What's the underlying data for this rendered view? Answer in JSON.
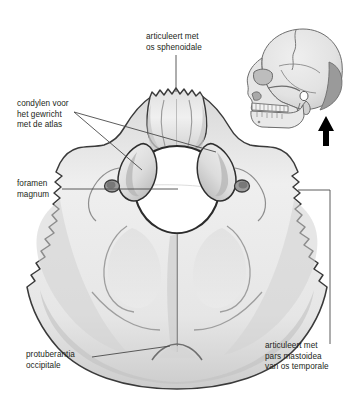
{
  "figure": {
    "background_color": "#ffffff",
    "bone_fill": "#ededed",
    "bone_shade_mid": "#c9c9c9",
    "bone_shade_dark": "#a8a8a8",
    "outline_color": "#3a3a3a",
    "foramen_fill": "#ffffff",
    "text_color": "#231f20",
    "leader_color": "#4a4a4a"
  },
  "labels": {
    "sphenoidale": "articuleert met\nos sphenoidale",
    "condylen": "condylen voor\nhet gewricht\nmet de atlas",
    "foramen": "foramen\nmagnum",
    "protuberantia": "protuberantia\noccipitale",
    "mastoidea": "articuleert met\npars mastoidea\nvan os temporale"
  },
  "inset": {
    "name": "lateral-skull-view",
    "highlight_color": "#9a9a9a",
    "skull_fill": "#e4e4e4",
    "arrow_color": "#000000",
    "arrow_direction": "up"
  }
}
